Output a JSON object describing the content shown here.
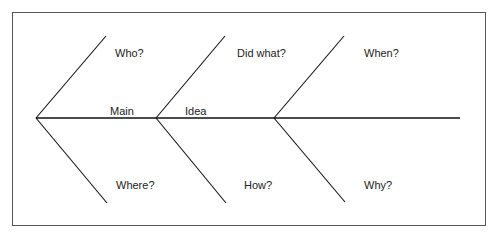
{
  "diagram": {
    "type": "fishbone",
    "spine_label_parts": [
      "Main",
      "Idea"
    ],
    "categories": {
      "top": [
        "Who?",
        "Did what?",
        "When?"
      ],
      "bottom": [
        "Where?",
        "How?",
        "Why?"
      ]
    }
  }
}
